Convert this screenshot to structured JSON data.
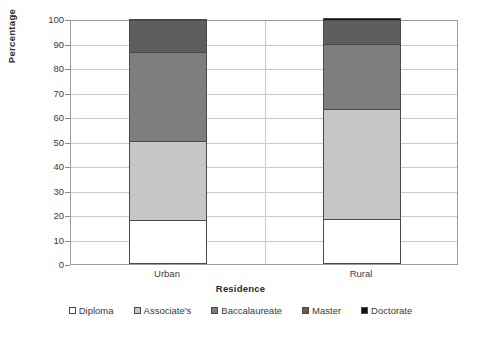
{
  "chart_data": {
    "type": "bar",
    "subtype": "stacked-100",
    "title": "",
    "xlabel": "Residence",
    "ylabel": "Percentage",
    "categories": [
      "Urban",
      "Rural"
    ],
    "ylim": [
      0,
      100
    ],
    "yticks": [
      0,
      10,
      20,
      30,
      40,
      50,
      60,
      70,
      80,
      90,
      100
    ],
    "ytick_labels": [
      "0",
      "10",
      "20",
      "30",
      "40",
      "50",
      "60",
      "70",
      "80",
      "90",
      "100"
    ],
    "grid": true,
    "legend_position": "bottom",
    "series": [
      {
        "name": "Diploma",
        "color": "#ffffff",
        "values": [
          18.0,
          18.5
        ]
      },
      {
        "name": "Associate's",
        "color": "#c6c6c6",
        "values": [
          32.3,
          44.8
        ]
      },
      {
        "name": "Baccalaureate",
        "color": "#7e7e7e",
        "values": [
          36.3,
          26.7
        ]
      },
      {
        "name": "Master",
        "color": "#5e5e5e",
        "values": [
          12.9,
          9.8
        ]
      },
      {
        "name": "Doctorate",
        "color": "#111111",
        "values": [
          0.5,
          0.2
        ]
      }
    ],
    "cumulative_tops": {
      "Urban": [
        18.0,
        50.3,
        86.6,
        99.5,
        100.0
      ],
      "Rural": [
        18.5,
        63.3,
        90.0,
        99.8,
        100.0
      ]
    }
  },
  "legend": {
    "items": [
      {
        "label": "Diploma",
        "color": "#ffffff"
      },
      {
        "label": "Associate's",
        "color": "#c6c6c6"
      },
      {
        "label": "Baccalaureate",
        "color": "#7e7e7e"
      },
      {
        "label": "Master",
        "color": "#5e5e5e"
      },
      {
        "label": "Doctorate",
        "color": "#111111"
      }
    ]
  },
  "colors": {
    "axis": "#9a9a9a",
    "grid": "#c9c9c9",
    "text": "#3a3a3a",
    "bar_border": "#4a4a4a",
    "background": "#ffffff"
  }
}
